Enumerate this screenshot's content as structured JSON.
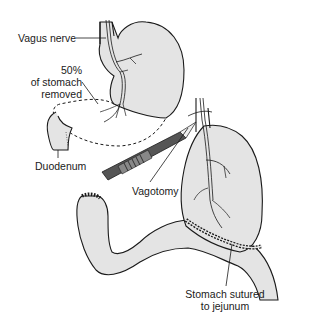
{
  "diagram": {
    "colors": {
      "organ_fill": "#e4e4e4",
      "outline": "#1a1a1a",
      "nerve_fill": "#f4f4f4",
      "background": "#ffffff"
    },
    "labels": {
      "vagus_nerve": "Vagus nerve",
      "removed_line1": "50%",
      "removed_line2": "of stomach",
      "removed_line3": "removed",
      "duodenum": "Duodenum",
      "vagotomy": "Vagotomy",
      "sutured_line1": "Stomach sutured",
      "sutured_line2": "to jejunum"
    }
  }
}
